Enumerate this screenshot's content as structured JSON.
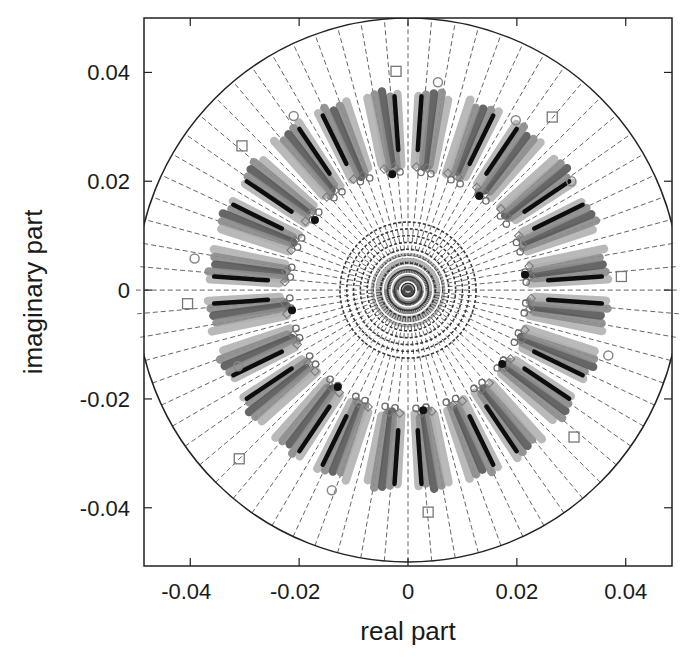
{
  "chart_data": {
    "type": "scatter",
    "title": "",
    "xlabel": "real part",
    "ylabel": "imaginary part",
    "xlim": [
      -0.0485,
      0.0485
    ],
    "ylim": [
      -0.0507,
      0.05
    ],
    "xticks": [
      -0.04,
      -0.02,
      0,
      0.02,
      0.04
    ],
    "xtick_labels": [
      "-0.04",
      "-0.02",
      "0",
      "0.02",
      "0.04"
    ],
    "yticks": [
      0.04,
      0.02,
      0,
      -0.02,
      -0.04
    ],
    "ytick_labels": [
      "0.04",
      "0.02",
      "0",
      "-0.02",
      "-0.04"
    ],
    "grid": "polar (dashed radial lines every 5 degrees, concentric circles)",
    "legend": null,
    "boundary_circle_radius": 0.05,
    "radial_line_step_deg": 5,
    "concentric_circle_count": 10,
    "concentric_circle_max_radius": 0.0125,
    "ring": {
      "description": "Clustered eigenvalue estimates forming an annulus of 24 radial clusters",
      "inner_radius": 0.0225,
      "outer_radius": 0.0368,
      "cluster_count": 24,
      "cluster_angle_offset_deg": 7.5,
      "bars_per_cluster": 5,
      "bar_spread_deg": 2.2
    },
    "series": [
      {
        "name": "filled-circle poles",
        "marker": "filled-circle",
        "color": "#111111",
        "points": [
          [
            -0.0029,
            0.0213
          ],
          [
            0.0131,
            0.0173
          ],
          [
            -0.0171,
            0.0129
          ],
          [
            0.0215,
            0.0028
          ],
          [
            -0.0213,
            -0.0037
          ],
          [
            0.0173,
            -0.0136
          ],
          [
            -0.0129,
            -0.0178
          ],
          [
            0.0028,
            -0.0221
          ]
        ]
      },
      {
        "name": "square outliers",
        "marker": "open-square",
        "color": "#777777",
        "points": [
          [
            -0.0022,
            0.0402
          ],
          [
            0.0392,
            0.0025
          ],
          [
            -0.0405,
            -0.0025
          ],
          [
            0.0037,
            -0.0408
          ],
          [
            -0.031,
            -0.031
          ],
          [
            0.0305,
            -0.027
          ],
          [
            -0.0305,
            0.0265
          ],
          [
            0.0265,
            0.0318
          ]
        ]
      },
      {
        "name": "open-circle markers",
        "marker": "open-circle",
        "color": "#888888",
        "points": [
          [
            0.0055,
            0.0382
          ],
          [
            -0.0392,
            0.0058
          ],
          [
            0.0368,
            -0.012
          ],
          [
            -0.014,
            -0.0368
          ],
          [
            0.0198,
            0.0312
          ],
          [
            -0.0312,
            -0.014
          ],
          [
            0.03,
            0.02
          ],
          [
            -0.021,
            0.032
          ]
        ]
      }
    ],
    "colors": {
      "cluster_light": "#b4b4b4",
      "cluster_mid": "#8c8c8c",
      "cluster_dark": "#5a5a5a",
      "cluster_black": "#0d0d0d",
      "grid": "#555555",
      "axes": "#222222"
    }
  }
}
